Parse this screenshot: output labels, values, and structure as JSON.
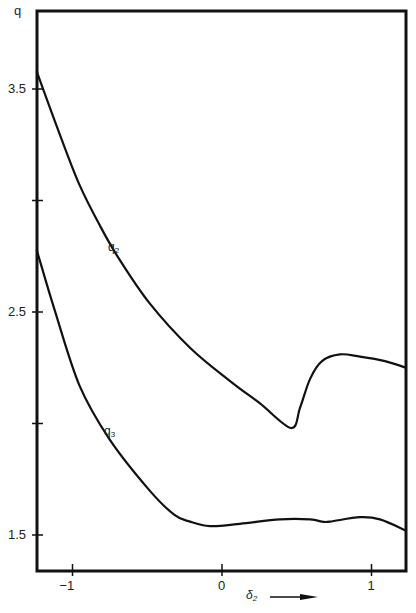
{
  "chart_data": {
    "type": "line",
    "title": "",
    "xlabel": "δ₂",
    "ylabel": "q",
    "xlim": [
      -1.24,
      1.23
    ],
    "ylim": [
      1.34,
      3.84
    ],
    "grid": false,
    "legend": "inline labels on curves",
    "x_ticks": [
      {
        "value": -1,
        "label": "−1"
      },
      {
        "value": 0,
        "label": "0"
      },
      {
        "value": 1,
        "label": "1"
      }
    ],
    "y_ticks": [
      {
        "value": 3.5,
        "label": "3.5"
      },
      {
        "value": 3.0,
        "label": ""
      },
      {
        "value": 2.5,
        "label": "2.5"
      },
      {
        "value": 2.0,
        "label": ""
      },
      {
        "value": 1.5,
        "label": "1.5"
      }
    ],
    "x_axis_arrow": "right",
    "series": [
      {
        "name": "q2",
        "label": "q",
        "label_sub": "2",
        "x": [
          -1.24,
          -1.087,
          -0.953,
          -0.819,
          -0.699,
          -0.485,
          -0.214,
          0.054,
          0.254,
          0.462,
          0.522,
          0.589,
          0.669,
          0.789,
          0.923,
          1.09,
          1.23
        ],
        "y": [
          3.58,
          3.3,
          3.07,
          2.89,
          2.75,
          2.54,
          2.34,
          2.19,
          2.09,
          1.98,
          2.07,
          2.2,
          2.28,
          2.31,
          2.3,
          2.28,
          2.25
        ]
      },
      {
        "name": "q3",
        "label": "q",
        "label_sub": "3",
        "x": [
          -1.24,
          -1.12,
          -0.953,
          -0.753,
          -0.485,
          -0.318,
          -0.214,
          -0.08,
          0.12,
          0.388,
          0.589,
          0.669,
          0.722,
          0.923,
          1.057,
          1.23
        ],
        "y": [
          2.78,
          2.51,
          2.17,
          1.93,
          1.7,
          1.59,
          1.56,
          1.54,
          1.55,
          1.57,
          1.57,
          1.56,
          1.56,
          1.58,
          1.57,
          1.52
        ]
      }
    ]
  },
  "axes": {
    "y_title": "q",
    "x_title": "δ",
    "x_title_sub": "2"
  }
}
